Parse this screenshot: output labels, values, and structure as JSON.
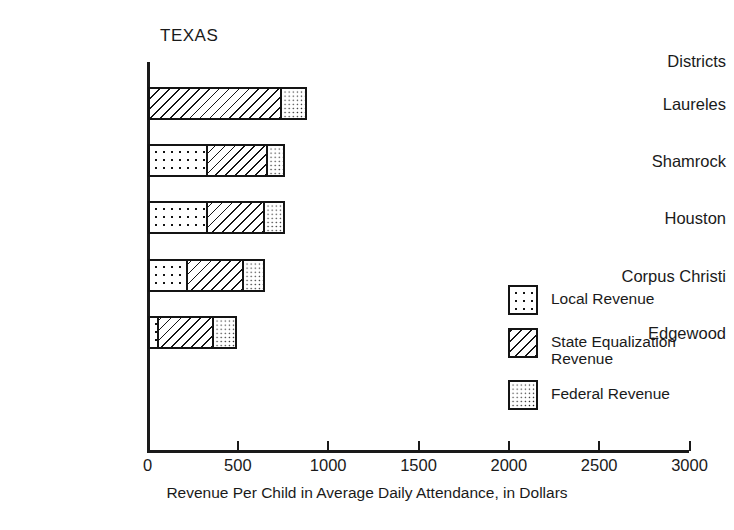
{
  "chart_data": {
    "type": "bar",
    "orientation": "horizontal",
    "stacked": true,
    "title": "TEXAS",
    "xlabel": "Revenue Per Child in Average Daily Attendance, in Dollars",
    "ylabel": "Districts",
    "xlim": [
      0,
      3000
    ],
    "xticks": [
      0,
      500,
      1000,
      1500,
      2000,
      2500,
      3000
    ],
    "xtick_labels": [
      "0",
      "500",
      "1000",
      "1500",
      "2000",
      "2500",
      "3000"
    ],
    "grid": false,
    "legend_position": "right",
    "categories": [
      "Laureles",
      "Shamrock",
      "Houston",
      "Corpus Christi",
      "Edgewood"
    ],
    "series": [
      {
        "name": "Local Revenue",
        "pattern": "coarse-dots",
        "values": [
          0,
          320,
          320,
          210,
          45
        ]
      },
      {
        "name": "State Equalization Revenue",
        "pattern": "diagonal-hatch",
        "values": [
          740,
          345,
          325,
          320,
          320
        ]
      },
      {
        "name": "Federal Revenue",
        "pattern": "fine-dots",
        "values": [
          145,
          95,
          115,
          120,
          130
        ]
      }
    ],
    "totals": [
      885,
      760,
      760,
      650,
      495
    ]
  },
  "legend": {
    "items": [
      {
        "label": "Local Revenue",
        "pattern": "coarse-dots"
      },
      {
        "label": "State Equalization\nRevenue",
        "pattern": "diagonal-hatch"
      },
      {
        "label": "Federal Revenue",
        "pattern": "fine-dots"
      }
    ]
  },
  "colors": {
    "ink": "#141414",
    "background": "#ffffff"
  }
}
